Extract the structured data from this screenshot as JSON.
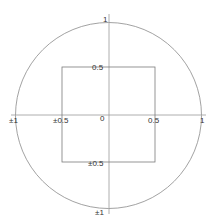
{
  "diagram": {
    "colors": {
      "stroke": "#8a8a8a",
      "axis": "#9a9a9a",
      "text": "#333333",
      "background": "#ffffff"
    },
    "circle": {
      "radius_units": 1
    },
    "square": {
      "half_width_units": 0.5
    },
    "labels": {
      "top": "1",
      "square_top": "0.5",
      "left": "±1",
      "square_left": "±0.5",
      "origin": "0",
      "square_right": "0.5",
      "right": "1",
      "square_bottom": "±0.5",
      "bottom": "±1"
    }
  }
}
